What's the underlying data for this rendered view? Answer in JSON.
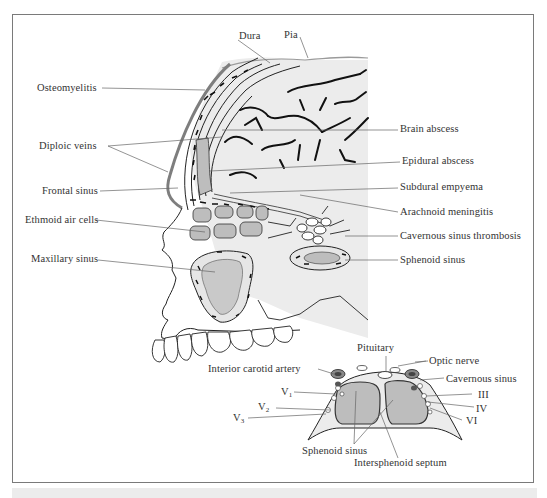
{
  "figure": {
    "main_diagram": {
      "title": "Sagittal section of skull and brain showing complications of sinusitis",
      "top_labels": {
        "dura": "Dura",
        "pia": "Pia"
      },
      "left_labels": [
        "Osteomyelitis",
        "Diploic veins",
        "Frontal sinus",
        "Ethmoid air cells",
        "Maxillary sinus"
      ],
      "right_labels": [
        "Brain abscess",
        "Epidural abscess",
        "Subdural empyema",
        "Arachnoid meningitis",
        "Cavernous sinus thrombosis",
        "Sphenoid sinus"
      ]
    },
    "inset_diagram": {
      "title": "Coronal section through sphenoid sinus and cavernous sinuses",
      "labels": {
        "pituitary": "Pituitary",
        "optic_nerve": "Optic nerve",
        "interior_carotid_artery": "Interior carotid artery",
        "cavernous_sinus": "Cavernous sinus",
        "v1": "V",
        "v1_sub": "1",
        "v2": "V",
        "v2_sub": "2",
        "v3": "V",
        "v3_sub": "3",
        "iii": "III",
        "iv": "IV",
        "vi": "VI",
        "sphenoid_sinus": "Sphenoid sinus",
        "intersphenoid_septum": "Intersphenoid septum"
      }
    },
    "colors": {
      "frame": "#7a7a7a",
      "skull_fill": "#e6e6e6",
      "sinus_fill": "#bdbdbd",
      "brain_fill": "#ededed",
      "outline": "#1a1a1a",
      "label_text": "#333333",
      "leader_line": "#666666",
      "osteomyelitis_band": "#808080"
    }
  }
}
